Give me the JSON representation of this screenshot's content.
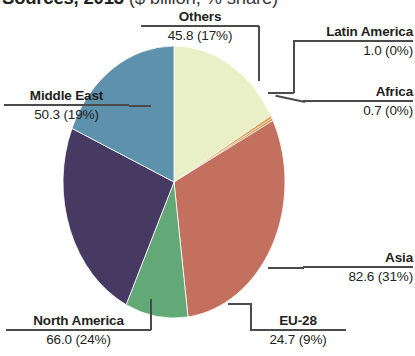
{
  "title": {
    "main": "Sources, 2013",
    "units": "($ billion, % share)",
    "note": "title is cropped by the top edge of the screenshot"
  },
  "chart_data": {
    "type": "pie",
    "title": "Sources, 2013 ($ billion, % share)",
    "xlabel": "",
    "ylabel": "",
    "value_units": "$ billion",
    "legend_position": "callout-labels",
    "grid": false,
    "start_angle_deg": 0,
    "direction": "clockwise",
    "categories": [
      "Others",
      "Latin America",
      "Africa",
      "Asia",
      "EU-28",
      "North America",
      "Middle East"
    ],
    "values": [
      45.8,
      1.0,
      0.7,
      82.6,
      24.7,
      66.0,
      50.3
    ],
    "percents": [
      17,
      0,
      0,
      31,
      9,
      24,
      19
    ],
    "colors": [
      "#e9f0c6",
      "#e0a257",
      "#c98f43",
      "#c4705e",
      "#63a877",
      "#463a63",
      "#5e91ab"
    ],
    "slices": [
      {
        "label": "Others",
        "value": "45.8",
        "percent": "17%",
        "display": "45.8 (17%)",
        "color": "#e9f0c6"
      },
      {
        "label": "Latin America",
        "value": "1.0",
        "percent": "0%",
        "display": "1.0 (0%)",
        "color": "#e0a257"
      },
      {
        "label": "Africa",
        "value": "0.7",
        "percent": "0%",
        "display": "0.7 (0%)",
        "color": "#c98f43"
      },
      {
        "label": "Asia",
        "value": "82.6",
        "percent": "31%",
        "display": "82.6 (31%)",
        "color": "#c4705e"
      },
      {
        "label": "EU-28",
        "value": "24.7",
        "percent": "9%",
        "display": "24.7 (9%)",
        "color": "#63a877"
      },
      {
        "label": "North America",
        "value": "66.0",
        "percent": "24%",
        "display": "66.0 (24%)",
        "color": "#463a63"
      },
      {
        "label": "Middle East",
        "value": "50.3",
        "percent": "19%",
        "display": "50.3 (19%)",
        "color": "#5e91ab"
      }
    ]
  }
}
